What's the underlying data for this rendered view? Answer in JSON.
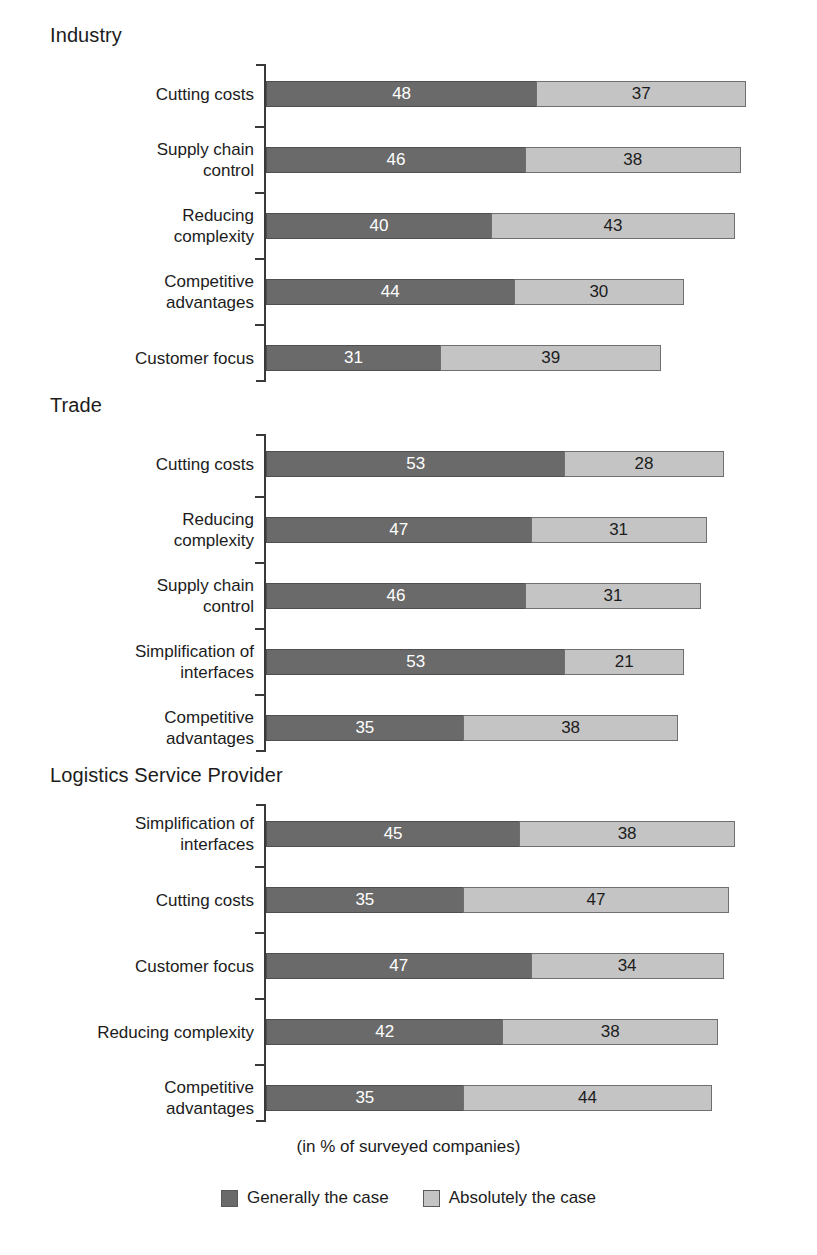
{
  "chart_data": {
    "type": "bar",
    "subtype": "stacked-horizontal",
    "title": "",
    "xlabel": "(in % of surveyed companies)",
    "ylabel": "",
    "xlim": [
      0,
      90
    ],
    "grid": false,
    "legend_position": "bottom-center",
    "legend": [
      "Generally the case",
      "Absolutely the case"
    ],
    "series": [
      {
        "name": "Generally the case",
        "color": "#6a6a6a"
      },
      {
        "name": "Absolutely the case",
        "color": "#c4c4c4"
      }
    ],
    "panels": [
      {
        "title": "Industry",
        "categories": [
          "Cutting costs",
          "Supply chain\ncontrol",
          "Reducing\ncomplexity",
          "Competitive\nadvantages",
          "Customer focus"
        ],
        "generally": [
          48,
          46,
          40,
          44,
          31
        ],
        "absolutely": [
          37,
          38,
          43,
          30,
          39
        ]
      },
      {
        "title": "Trade",
        "categories": [
          "Cutting costs",
          "Reducing\ncomplexity",
          "Supply chain\ncontrol",
          "Simplification of\ninterfaces",
          "Competitive\nadvantages"
        ],
        "generally": [
          53,
          47,
          46,
          53,
          35
        ],
        "absolutely": [
          28,
          31,
          31,
          21,
          38
        ]
      },
      {
        "title": "Logistics Service Provider",
        "categories": [
          "Simplification of\ninterfaces",
          "Cutting costs",
          "Customer focus",
          "Reducing complexity",
          "Competitive\nadvantages"
        ],
        "generally": [
          45,
          35,
          47,
          42,
          35
        ],
        "absolutely": [
          38,
          47,
          34,
          38,
          44
        ]
      }
    ]
  },
  "footer": {
    "axis_note": "(in % of surveyed companies)"
  },
  "legend": {
    "items": [
      {
        "label": "Generally the case",
        "color": "#6a6a6a"
      },
      {
        "label": "Absolutely the case",
        "color": "#c4c4c4"
      }
    ]
  },
  "scale": {
    "px_per_unit": 5.65,
    "origin_x": 266
  }
}
